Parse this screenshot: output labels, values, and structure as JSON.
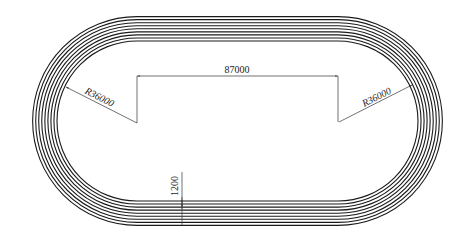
{
  "drawing": {
    "title": "Running track plan",
    "lane_line_count": 9,
    "lane_count": 8,
    "colors": {
      "track_line": "#1a1a1a",
      "dimension_line": "#333333",
      "background": "#ffffff"
    },
    "geometry": {
      "center_y": 121,
      "left_center_x": 137,
      "right_center_x": 338,
      "inner_radius_px": 80,
      "lane_spacing_px": 3.05
    }
  },
  "dimensions": {
    "straight_length": "87000",
    "left_radius": "R36000",
    "right_radius": "R36000",
    "lane_width": "1200"
  }
}
